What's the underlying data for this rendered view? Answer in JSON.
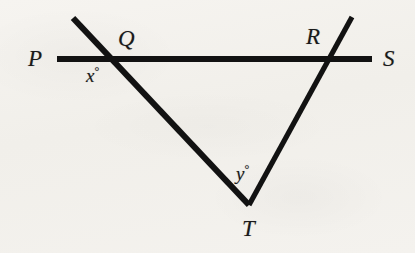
{
  "figure": {
    "kind": "geometry-diagram",
    "background_color": "#f3f1ed",
    "ink_color": "#121212"
  },
  "labels": {
    "p": "P",
    "q": "Q",
    "r": "R",
    "s": "S",
    "t": "T",
    "x_angle": "x",
    "y_angle": "y",
    "degree_symbol": "°"
  },
  "chart_data": {
    "type": "diagram",
    "title": "",
    "points": [
      {
        "name": "P",
        "label": "P",
        "x": 40,
        "y": 59,
        "role": "line-endpoint-label"
      },
      {
        "name": "Q",
        "label": "Q",
        "x": 108,
        "y": 59,
        "role": "intersection"
      },
      {
        "name": "R",
        "label": "R",
        "x": 330,
        "y": 59,
        "role": "intersection"
      },
      {
        "name": "S",
        "label": "S",
        "x": 390,
        "y": 59,
        "role": "line-endpoint-label"
      },
      {
        "name": "T",
        "label": "T",
        "x": 249,
        "y": 205,
        "role": "apex"
      }
    ],
    "segments": [
      {
        "name": "PS",
        "from": [
          57,
          59
        ],
        "to": [
          372,
          59
        ],
        "stroke_width": 5,
        "description": "horizontal line through Q and R"
      },
      {
        "name": "QT",
        "from": [
          73,
          18
        ],
        "to": [
          249,
          205
        ],
        "stroke_width": 6,
        "description": "left transversal from above Q down to T"
      },
      {
        "name": "RT",
        "from": [
          352,
          17
        ],
        "to": [
          249,
          205
        ],
        "stroke_width": 6,
        "description": "right transversal from above R down to T"
      }
    ],
    "angles": [
      {
        "name": "x",
        "label": "x°",
        "at": "Q",
        "position": [
          98,
          75
        ],
        "description": "angle below line PS on the left side of transversal at Q"
      },
      {
        "name": "y",
        "label": "y°",
        "at": "T",
        "position": [
          248,
          172
        ],
        "description": "interior angle at apex T"
      }
    ]
  }
}
